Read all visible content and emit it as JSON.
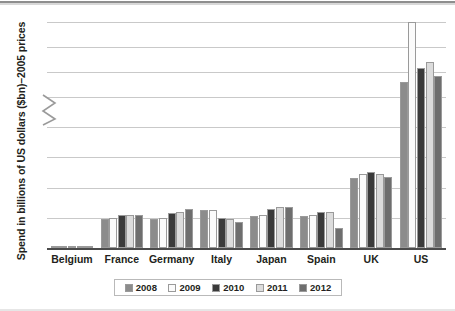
{
  "chart_data": {
    "type": "bar",
    "title": "",
    "xlabel": "",
    "ylabel": "Spend in billions of US dollars ($bn)–2005 prices",
    "categories": [
      "Belgium",
      "France",
      "Germany",
      "Italy",
      "Japan",
      "Spain",
      "UK",
      "US"
    ],
    "series": [
      {
        "name": "2008",
        "color": "#8c8c8c",
        "values": [
          0.05,
          0.95,
          0.95,
          1.25,
          1.05,
          1.05,
          2.3,
          28.0
        ]
      },
      {
        "name": "2009",
        "color": "#fbfbfb",
        "values": [
          0.05,
          1.0,
          1.0,
          1.25,
          1.1,
          1.1,
          2.45,
          40.0
        ]
      },
      {
        "name": "2010",
        "color": "#3a3a3a",
        "values": [
          0.06,
          1.1,
          1.15,
          1.0,
          1.3,
          1.2,
          2.5,
          30.8
        ]
      },
      {
        "name": "2011",
        "color": "#dcdcdc",
        "values": [
          0.05,
          1.1,
          1.2,
          0.95,
          1.35,
          1.2,
          2.45,
          32.0
        ]
      },
      {
        "name": "2012",
        "color": "#6e6e6e",
        "values": [
          0.05,
          1.1,
          1.3,
          0.85,
          1.35,
          0.65,
          2.35,
          29.3
        ]
      }
    ],
    "y_ticks_lower": [
      "0",
      "1",
      "2",
      "3",
      "4"
    ],
    "y_ticks_upper": [
      "25",
      "30",
      "35",
      "40"
    ],
    "ylim_lower": [
      0,
      4
    ],
    "ylim_upper": [
      25,
      40
    ],
    "axis_break": true,
    "grid": true,
    "legend_position": "bottom",
    "legend_entries": [
      "2008",
      "2009",
      "2010",
      "2011",
      "2012"
    ]
  },
  "axis": {
    "break_marker": "zigzag"
  }
}
